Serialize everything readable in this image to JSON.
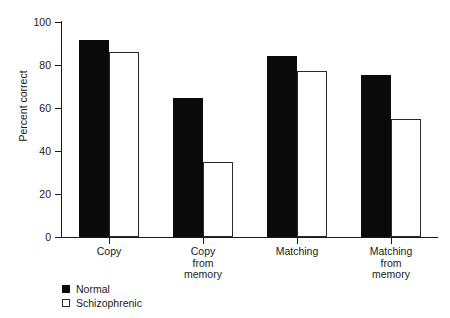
{
  "chart_data": {
    "type": "bar",
    "title": "",
    "xlabel": "",
    "ylabel": "Percent correct",
    "ylim": [
      0,
      100
    ],
    "yticks": [
      0,
      20,
      40,
      60,
      80,
      100
    ],
    "ytick_labels": [
      "0",
      "20",
      "40",
      "60",
      "80",
      "100"
    ],
    "grid": false,
    "legend_position": "below-axis-left",
    "categories": [
      "Copy",
      "Copy from memory",
      "Matching",
      "Matching from memory"
    ],
    "category_label_lines": [
      [
        "Copy"
      ],
      [
        "Copy",
        "from",
        "memory"
      ],
      [
        "Matching"
      ],
      [
        "Matching",
        "from",
        "memory"
      ]
    ],
    "series": [
      {
        "name": "Normal",
        "color": "#0a0a0a",
        "style": "filled",
        "values": [
          91.5,
          64.5,
          84,
          75.5
        ]
      },
      {
        "name": "Schizophrenic",
        "color": "#ffffff",
        "style": "open",
        "values": [
          86,
          35,
          77,
          55
        ]
      }
    ]
  },
  "legend": {
    "items": [
      {
        "label": "Normal",
        "swatch": "filled-square"
      },
      {
        "label": "Schizophrenic",
        "swatch": "open-square"
      }
    ]
  },
  "axis": {
    "y_title": "Percent correct"
  }
}
